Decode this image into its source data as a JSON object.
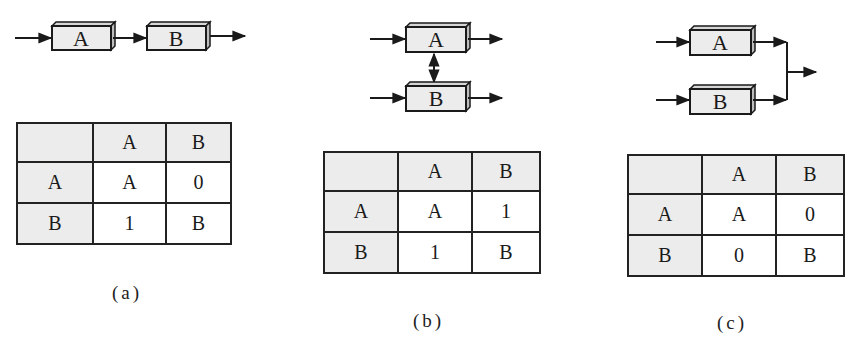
{
  "figures": [
    {
      "id": "a",
      "caption": "(a)",
      "description": "Series arrangement: A followed by B",
      "boxes": [
        "A",
        "B"
      ],
      "table": {
        "col_headers": [
          "",
          "A",
          "B"
        ],
        "rows": [
          {
            "header": "A",
            "cells": [
              "A",
              "0"
            ]
          },
          {
            "header": "B",
            "cells": [
              "1",
              "B"
            ]
          }
        ]
      }
    },
    {
      "id": "b",
      "caption": "(b)",
      "description": "Parallel arrangement with bidirectional link between A and B",
      "boxes": [
        "A",
        "B"
      ],
      "table": {
        "col_headers": [
          "",
          "A",
          "B"
        ],
        "rows": [
          {
            "header": "A",
            "cells": [
              "A",
              "1"
            ]
          },
          {
            "header": "B",
            "cells": [
              "1",
              "B"
            ]
          }
        ]
      }
    },
    {
      "id": "c",
      "caption": "(c)",
      "description": "Parallel independent arrangement, outputs merge",
      "boxes": [
        "A",
        "B"
      ],
      "table": {
        "col_headers": [
          "",
          "A",
          "B"
        ],
        "rows": [
          {
            "header": "A",
            "cells": [
              "A",
              "0"
            ]
          },
          {
            "header": "B",
            "cells": [
              "0",
              "B"
            ]
          }
        ]
      }
    }
  ],
  "colors": {
    "box_fill": "#ececec",
    "box_side": "#bdbdbd",
    "line": "#1a1a1a",
    "header_cell": "#ececec"
  }
}
